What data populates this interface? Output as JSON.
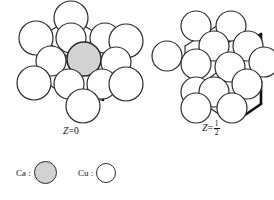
{
  "figure": {
    "kind": "crystal-structure-projection",
    "background_color": "#ffffff",
    "line_color": "#2b2b2b",
    "bold_line_color": "#111111",
    "atom_fill_ca": "#d2d2d2",
    "atom_fill_cu": "#ffffff"
  },
  "panels": [
    {
      "id": "z0",
      "caption_var": "Z",
      "caption_eq": "=",
      "caption_value": "0",
      "caption_plain": "Z = 0",
      "description": "hexagonal rosette of Cu circles with one central Ca circle",
      "atom_counts": {
        "Ca": 1,
        "Cu": 13
      }
    },
    {
      "id": "zhalf",
      "caption_var": "Z",
      "caption_eq": "=",
      "caption_numerator": "1",
      "caption_denominator": "2",
      "caption_plain": "Z = 1/2",
      "description": "honeycomb net of Cu circles with one hexagon outlined in bold",
      "atom_counts": {
        "Ca": 0,
        "Cu": 13
      }
    }
  ],
  "legend": {
    "entries": [
      {
        "id": "ca",
        "label": "Ca :",
        "element": "Ca",
        "swatch": "filled-gray-circle",
        "color": "#d2d2d2"
      },
      {
        "id": "cu",
        "label": "Cu :",
        "element": "Cu",
        "swatch": "open-white-circle",
        "color": "#ffffff"
      }
    ]
  },
  "chart_data": {
    "type": "scatter",
    "title": "",
    "xlabel": "",
    "ylabel": "",
    "note": "Projected atom positions, panel-local pixel coordinates (r = circle radius)",
    "panels": {
      "z0": {
        "bonds_bold": [
          [
            63,
            55,
            63,
            96
          ],
          [
            63,
            55,
            95,
            37
          ],
          [
            63,
            55,
            95,
            74
          ],
          [
            95,
            74,
            95,
            96
          ]
        ],
        "bonds_thin": [
          [
            63,
            14,
            32,
            33
          ],
          [
            63,
            14,
            95,
            33
          ],
          [
            32,
            33,
            32,
            74
          ],
          [
            95,
            33,
            95,
            55
          ],
          [
            32,
            74,
            63,
            96
          ],
          [
            63,
            96,
            95,
            96
          ],
          [
            32,
            33,
            63,
            55
          ],
          [
            63,
            55,
            32,
            74
          ]
        ],
        "atoms": [
          {
            "el": "Cu",
            "x": 63,
            "y": 14,
            "r": 17
          },
          {
            "el": "Cu",
            "x": 28,
            "y": 34,
            "r": 17
          },
          {
            "el": "Cu",
            "x": 63,
            "y": 34,
            "r": 15
          },
          {
            "el": "Cu",
            "x": 97,
            "y": 34,
            "r": 15
          },
          {
            "el": "Cu",
            "x": 118,
            "y": 37,
            "r": 17
          },
          {
            "el": "Cu",
            "x": 43,
            "y": 57,
            "r": 15
          },
          {
            "el": "Ca",
            "x": 76,
            "y": 55,
            "r": 17
          },
          {
            "el": "Cu",
            "x": 108,
            "y": 58,
            "r": 15
          },
          {
            "el": "Cu",
            "x": 26,
            "y": 79,
            "r": 17
          },
          {
            "el": "Cu",
            "x": 61,
            "y": 80,
            "r": 15
          },
          {
            "el": "Cu",
            "x": 94,
            "y": 80,
            "r": 15
          },
          {
            "el": "Cu",
            "x": 118,
            "y": 80,
            "r": 17
          },
          {
            "el": "Cu",
            "x": 75,
            "y": 102,
            "r": 17
          }
        ]
      },
      "zhalf": {
        "bonds_bold": [
          [
            92,
            42,
            92,
            64
          ],
          [
            92,
            64,
            73,
            78
          ],
          [
            73,
            78,
            73,
            100
          ],
          [
            73,
            100,
            92,
            113
          ],
          [
            92,
            113,
            111,
            100
          ],
          [
            111,
            100,
            111,
            78
          ],
          [
            111,
            78,
            92,
            64
          ],
          [
            92,
            42,
            111,
            30
          ],
          [
            111,
            30,
            111,
            52
          ]
        ],
        "bonds_thin": [
          [
            54,
            30,
            73,
            18
          ],
          [
            73,
            18,
            92,
            30
          ],
          [
            92,
            30,
            73,
            42
          ],
          [
            73,
            42,
            54,
            30
          ],
          [
            54,
            30,
            35,
            42
          ],
          [
            35,
            42,
            35,
            64
          ],
          [
            35,
            64,
            54,
            78
          ],
          [
            54,
            78,
            54,
            100
          ],
          [
            54,
            100,
            73,
            113
          ],
          [
            73,
            42,
            73,
            64
          ],
          [
            73,
            64,
            54,
            78
          ],
          [
            73,
            64,
            92,
            78
          ],
          [
            92,
            30,
            111,
            42
          ],
          [
            54,
            100,
            73,
            100
          ],
          [
            73,
            113,
            92,
            113
          ]
        ],
        "atoms": [
          {
            "el": "Cu",
            "x": 46,
            "y": 22,
            "r": 15
          },
          {
            "el": "Cu",
            "x": 81,
            "y": 22,
            "r": 15
          },
          {
            "el": "Cu",
            "x": 64,
            "y": 42,
            "r": 15
          },
          {
            "el": "Cu",
            "x": 98,
            "y": 42,
            "r": 15
          },
          {
            "el": "Cu",
            "x": 17,
            "y": 52,
            "r": 15
          },
          {
            "el": "Cu",
            "x": 46,
            "y": 60,
            "r": 15
          },
          {
            "el": "Cu",
            "x": 114,
            "y": 58,
            "r": 15
          },
          {
            "el": "Cu",
            "x": 80,
            "y": 63,
            "r": 15
          },
          {
            "el": "Cu",
            "x": 46,
            "y": 88,
            "r": 15
          },
          {
            "el": "Cu",
            "x": 97,
            "y": 80,
            "r": 15
          },
          {
            "el": "Cu",
            "x": 64,
            "y": 88,
            "r": 15
          },
          {
            "el": "Cu",
            "x": 46,
            "y": 104,
            "r": 15
          },
          {
            "el": "Cu",
            "x": 82,
            "y": 104,
            "r": 15
          }
        ]
      }
    }
  }
}
